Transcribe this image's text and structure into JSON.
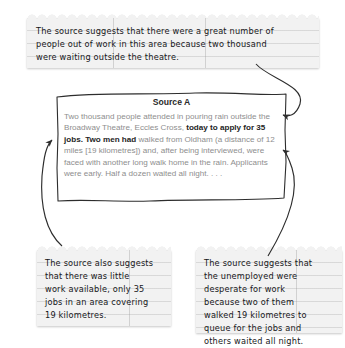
{
  "page": {
    "background_color": "#ffffff",
    "note_color": "#f2f2f2",
    "ink_color": "#16171a",
    "muted_text_color": "#8e8e8e",
    "highlight_text_color": "#242424"
  },
  "source_box": {
    "title": "Source A",
    "paragraph_plain": "Two thousand people attended in pouring rain outside the Broadway Theatre, Eccles Cross, today to apply for 35 jobs. Two men had walked from Oldham (a distance of 12 miles [19 kilometres]) and, after being interviewed, were faced with another long walk home in the rain. Applicants were early. Half a dozen waited all night. . . .",
    "segments": [
      {
        "text": "Two thousand people attended in pouring rain outside the Broadway Theatre, Eccles Cross, ",
        "emphasis": false
      },
      {
        "text": "today to apply for 35 jobs. Two men had ",
        "emphasis": true
      },
      {
        "text": "walked from Oldham (a distance of 12 miles [19 kilometres]) and, after being interviewed, were faced with another long walk home in the rain. Applicants were early. Half a dozen waited all night. . . .",
        "emphasis": false
      }
    ]
  },
  "notes": {
    "top": {
      "id": "note-top",
      "text": "The source suggests that there were a great number of\npeople out of work in this area because two thousand\nwere waiting outside the theatre."
    },
    "bottom_left": {
      "id": "note-bottom-left",
      "text": "The source also suggests\nthat there was little\nwork available, only 35\njobs in an area covering\n19 kilometres."
    },
    "bottom_right": {
      "id": "note-bottom-right",
      "text": "The source suggests that\nthe unemployed were\ndesperate for work\nbecause two of them\nwalked 19 kilometres to\nqueue for the jobs and\nothers waited all night."
    }
  },
  "connectors": [
    {
      "name": "top-note-to-source-right",
      "from": "note-top",
      "to": "source_box right edge, line 1"
    },
    {
      "name": "bottom-left-note-to-source-left",
      "from": "note-bottom-left",
      "to": "source_box left edge, '35 jobs'"
    },
    {
      "name": "bottom-right-note-to-source-right",
      "from": "note-bottom-right",
      "to": "source_box right edge, 'after being'"
    }
  ]
}
